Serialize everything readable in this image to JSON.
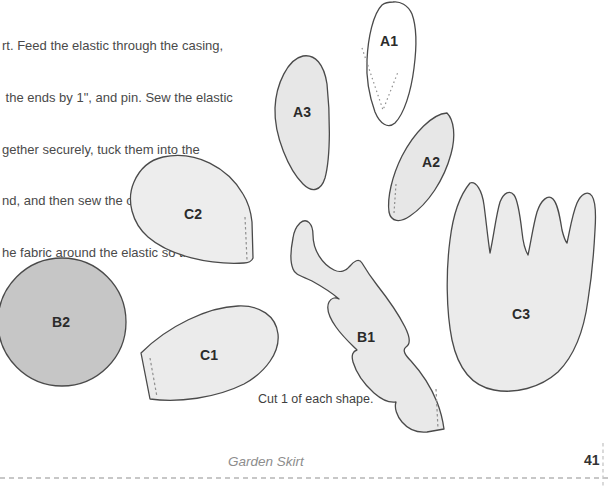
{
  "doc": {
    "instructions": [
      "rt. Feed the elastic through the casing,",
      " the ends by 1\", and pin. Sew the elastic",
      "gether securely, tuck them into the",
      "nd, and then sew the opening closed.",
      "he fabric around the elastic so the gathers",
      "n all the way around."
    ],
    "cut_note": "Cut 1 of each shape.",
    "footer": {
      "chapter_title": "Garden Skirt",
      "page_number": "41"
    }
  },
  "pieces": {
    "a1": {
      "label": "A1",
      "fill": "#ffffff"
    },
    "a2": {
      "label": "A2",
      "fill": "#e7e7e7"
    },
    "a3": {
      "label": "A3",
      "fill": "#e7e7e7"
    },
    "b1": {
      "label": "B1",
      "fill": "#e9e9e9"
    },
    "b2": {
      "label": "B2",
      "fill": "#c6c6c6"
    },
    "c1": {
      "label": "C1",
      "fill": "#ebebeb"
    },
    "c2": {
      "label": "C2",
      "fill": "#ededed"
    },
    "c3": {
      "label": "C3",
      "fill": "#ebebeb"
    }
  },
  "colors": {
    "outline": "#4a4a4a",
    "body_text": "#4a4a4a",
    "footer_text": "#8d8d8d",
    "page_number": "#333333",
    "trim_dash": "#b5b5b5"
  }
}
